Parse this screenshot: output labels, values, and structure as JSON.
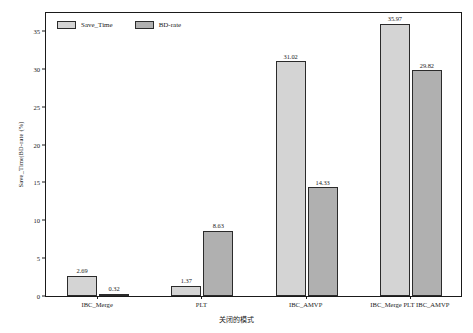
{
  "chart_data": {
    "type": "bar",
    "title": "",
    "xlabel": "关闭的模式",
    "ylabel": "Save_Time|BD-rate (%)",
    "ylim": [
      0,
      37.5
    ],
    "yticks": [
      0,
      5,
      10,
      15,
      20,
      25,
      30,
      35
    ],
    "ytick_labels": [
      "0",
      "5",
      "10",
      "15",
      "20",
      "25",
      "30",
      "35"
    ],
    "grid": false,
    "legend_position": "upper left",
    "categories": [
      "IBC_Merge",
      "PLT",
      "IBC_AMVP",
      "IBC_Merge  PLT  IBC_AMVP"
    ],
    "series": [
      {
        "name": "Save_Time",
        "color": "#d4d4d4",
        "values": [
          2.69,
          1.37,
          31.02,
          35.97
        ],
        "labels": [
          "2.69",
          "1.37",
          "31.02",
          "35.97"
        ]
      },
      {
        "name": "BD-rate",
        "color": "#b0b0b0",
        "values": [
          0.32,
          8.63,
          14.33,
          29.82
        ],
        "labels": [
          "0.32",
          "8.63",
          "14.33",
          "29.82"
        ]
      }
    ]
  },
  "style": {
    "background": "#ffffff",
    "axis_color": "#1a1a1a",
    "bar_border": "#2b2b2b"
  }
}
